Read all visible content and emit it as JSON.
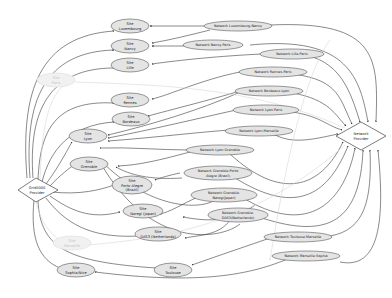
{
  "diagram": {
    "type": "directed-graph",
    "colors": {
      "node_fill": "#e4e4e4",
      "node_stroke": "#555555",
      "faded_fill": "#f1f1f1",
      "faded_stroke": "#dcdcdc",
      "edge": "#3a3a3a",
      "faded_edge": "#d6d6d6"
    },
    "providers": {
      "grid5000": {
        "line1": "Grid5000",
        "line2": "Provider"
      },
      "network": {
        "line1": "Network",
        "line2": "Provider"
      }
    },
    "sites": [
      {
        "id": "luxembourg",
        "line1": "Site",
        "line2": "Luxembourg",
        "faded": false
      },
      {
        "id": "nancy",
        "line1": "Site",
        "line2": "Nancy",
        "faded": false
      },
      {
        "id": "lille",
        "line1": "Site",
        "line2": "Lille",
        "faded": false
      },
      {
        "id": "paris",
        "line1": "Site",
        "line2": "Paris",
        "faded": true
      },
      {
        "id": "rennes",
        "line1": "Site",
        "line2": "Rennes",
        "faded": false
      },
      {
        "id": "bordeaux",
        "line1": "Site",
        "line2": "Bordeaux",
        "faded": false
      },
      {
        "id": "lyon",
        "line1": "Site",
        "line2": "Lyon",
        "faded": false
      },
      {
        "id": "grenoble",
        "line1": "Site",
        "line2": "Grenoble",
        "faded": false
      },
      {
        "id": "porto-alegre",
        "line1": "Site",
        "line2": "Porto Alegre",
        "line3": "(Brazil)",
        "faded": false
      },
      {
        "id": "nanaji",
        "line1": "Site",
        "line2": "Naregi (Japan)",
        "faded": false
      },
      {
        "id": "das3",
        "line1": "Site",
        "line2": "DAS3 (Netherlands)",
        "faded": false
      },
      {
        "id": "marseille",
        "line1": "Site",
        "line2": "Marseille",
        "faded": true
      },
      {
        "id": "sophia",
        "line1": "Site",
        "line2": "Sophia/Nice",
        "faded": false
      },
      {
        "id": "toulouse",
        "line1": "Site",
        "line2": "Toulouse",
        "faded": false
      }
    ],
    "networks": [
      {
        "id": "lux-nancy",
        "line1": "Network Luxembourg-Nancy"
      },
      {
        "id": "nancy-paris",
        "line1": "Network Nancy-Paris"
      },
      {
        "id": "lille-paris",
        "line1": "Network Lille-Paris"
      },
      {
        "id": "rennes-paris",
        "line1": "Network Rennes-Paris"
      },
      {
        "id": "bordeaux-lyon",
        "line1": "Network Bordeaux-Lyon"
      },
      {
        "id": "lyon-paris",
        "line1": "Network Lyon-Paris"
      },
      {
        "id": "lyon-marseille",
        "line1": "Network Lyon-Marseille"
      },
      {
        "id": "lyon-grenoble",
        "line1": "Network Lyon-Grenoble"
      },
      {
        "id": "grenoble-porto",
        "line1": "Network Grenoble-Porto",
        "line2": "Alegre (Brazil)"
      },
      {
        "id": "grenoble-naregi",
        "line1": "Network Grenoble-",
        "line2": "Naregi(Japan)"
      },
      {
        "id": "grenoble-das3",
        "line1": "Network Grenoble-",
        "line2": "DAS3(Netherlands)"
      },
      {
        "id": "toulouse-marseille",
        "line1": "Network Toulouse-Marseille"
      },
      {
        "id": "marseille-sophia",
        "line1": "Network Marseille-Sophia"
      }
    ]
  }
}
